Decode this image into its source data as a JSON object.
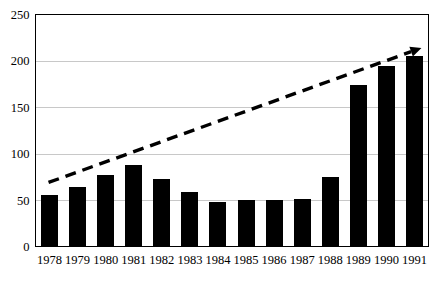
{
  "chart_data": {
    "type": "bar",
    "title": "",
    "subtitle": "",
    "xlabel": "",
    "ylabel": "",
    "categories": [
      "1978",
      "1979",
      "1980",
      "1981",
      "1982",
      "1983",
      "1984",
      "1985",
      "1986",
      "1987",
      "1988",
      "1989",
      "1990",
      "1991"
    ],
    "values": [
      56,
      64,
      77,
      88,
      73,
      59,
      48,
      50,
      50,
      51,
      75,
      174,
      194,
      205
    ],
    "series": [
      {
        "name": "",
        "values": [
          56,
          64,
          77,
          88,
          73,
          59,
          48,
          50,
          50,
          51,
          75,
          174,
          194,
          205
        ]
      }
    ],
    "ylim": [
      0,
      250
    ],
    "yticks": [
      0,
      50,
      100,
      150,
      200,
      250
    ],
    "ytick_labels": [
      "0",
      "50",
      "100",
      "150",
      "200",
      "250"
    ],
    "grid": true,
    "grid_axis": "y",
    "legend": false,
    "legend_position": "none",
    "annotations": [
      {
        "type": "trend-arrow",
        "style": "dashed",
        "label": "",
        "start_category": "1978",
        "start_value": 69,
        "end_category": "1991",
        "end_value": 214,
        "arrowhead": "end"
      }
    ],
    "bar_color": "#000000",
    "grid_color": "#c8c8c8",
    "axis_color": "#000000",
    "trend_color": "#000000",
    "background_color": "#ffffff"
  },
  "axes": {
    "y_axis_name": "value-axis",
    "x_axis_name": "year-axis"
  }
}
